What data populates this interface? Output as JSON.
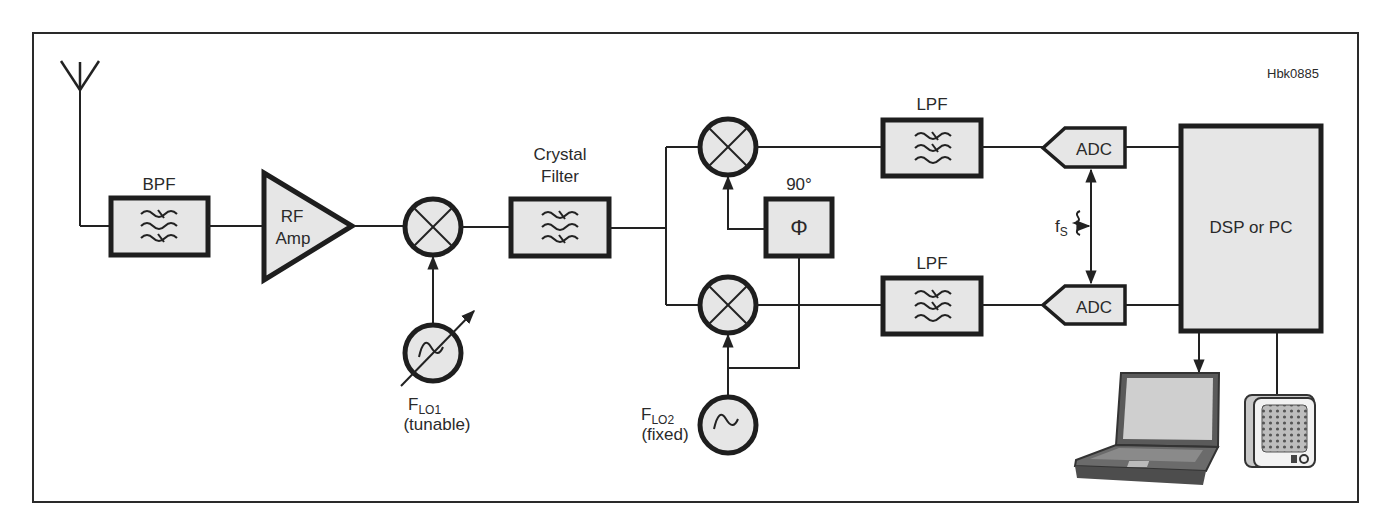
{
  "figure": {
    "id": "Hbk0885"
  },
  "blocks": {
    "bpf": {
      "label": "BPF"
    },
    "rf_amp": {
      "label_line1": "RF",
      "label_line2": "Amp"
    },
    "crystal_filter": {
      "label_line1": "Crystal",
      "label_line2": "Filter"
    },
    "phase_shift": {
      "label": "90°",
      "symbol": "Φ"
    },
    "lpf_top": {
      "label": "LPF"
    },
    "lpf_bottom": {
      "label": "LPF"
    },
    "adc_top": {
      "label": "ADC"
    },
    "adc_bottom": {
      "label": "ADC"
    },
    "dsp": {
      "label": "DSP or PC"
    }
  },
  "oscillators": {
    "lo1": {
      "name": "F",
      "subscript": "LO1",
      "note": "(tunable)"
    },
    "lo2": {
      "name": "F",
      "subscript": "LO2",
      "note": "(fixed)"
    }
  },
  "sample_clock": {
    "name": "f",
    "subscript": "S"
  },
  "icons": [
    "antenna-icon",
    "mixer-icon",
    "oscillator-icon",
    "laptop-icon",
    "speaker-icon"
  ],
  "colors": {
    "block_fill": "#e6e6e6",
    "stroke": "#1e1e1e",
    "background": "#ffffff"
  }
}
